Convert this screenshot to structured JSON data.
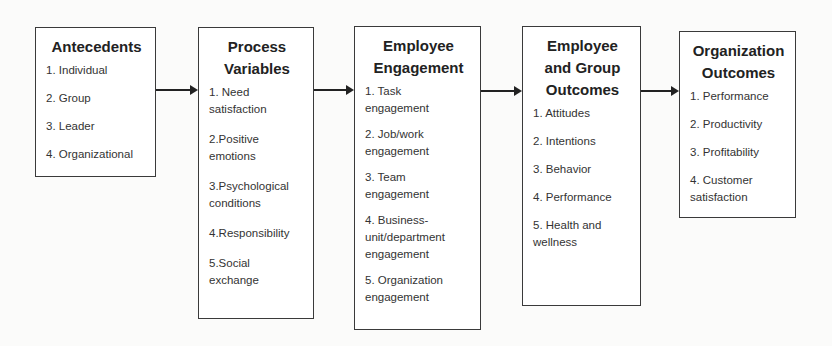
{
  "boxes": [
    {
      "title": "Antecedents",
      "items": [
        "1. Individual",
        "2. Group",
        "3. Leader",
        "4. Organizational"
      ]
    },
    {
      "title": "Process\nVariables",
      "items": [
        "1. Need\nsatisfaction",
        "2.Positive\nemotions",
        "3.Psychological\nconditions",
        "4.Responsibility",
        "5.Social\nexchange"
      ]
    },
    {
      "title": "Employee\nEngagement",
      "items": [
        "1.  Task\nengagement",
        "2. Job/work\nengagement",
        "3. Team\nengagement",
        "4. Business-\nunit/department\nengagement",
        "5. Organization\nengagement"
      ]
    },
    {
      "title": "Employee\nand Group\nOutcomes",
      "items": [
        "1. Attitudes",
        "2. Intentions",
        "3. Behavior",
        "4. Performance",
        "5. Health and\nwellness"
      ]
    },
    {
      "title": "Organization\nOutcomes",
      "items": [
        "1. Performance",
        "2. Productivity",
        "3. Profitability",
        "4. Customer\nsatisfaction"
      ]
    }
  ],
  "colors": {
    "border": "#3a3a3a",
    "arrow": "#222222",
    "background": "#fbfbfa"
  }
}
